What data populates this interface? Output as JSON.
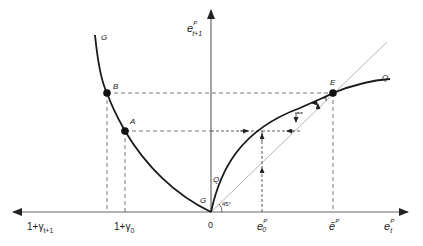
{
  "diagram": {
    "title": "",
    "vertical_axis": {
      "label": "e",
      "sup": "P",
      "sub": "t+1"
    },
    "horizontal_axis_right": {
      "label": "e",
      "sup": "P",
      "sub": "t"
    },
    "horizontal_axis_left": {
      "label": "1+γ",
      "sub": "t+1"
    },
    "origin_label": "0",
    "angle_label": "45°",
    "curves": {
      "G_top": "G",
      "G_bottom": "G",
      "Q_end": "Q",
      "Q_start": "Q"
    },
    "points": {
      "A": "A",
      "B": "B",
      "E": "E"
    },
    "ticks": {
      "gamma0": {
        "label": "1+γ",
        "sub": "0"
      },
      "e0": {
        "label": "e",
        "sup": "P",
        "sub": "0"
      },
      "ebar": {
        "label": "ē",
        "sup": "P"
      }
    },
    "colors": {
      "curve": "#1a1a1a",
      "axis": "#555555",
      "diagonal": "#b0b0b0",
      "dashed": "#444444"
    }
  }
}
